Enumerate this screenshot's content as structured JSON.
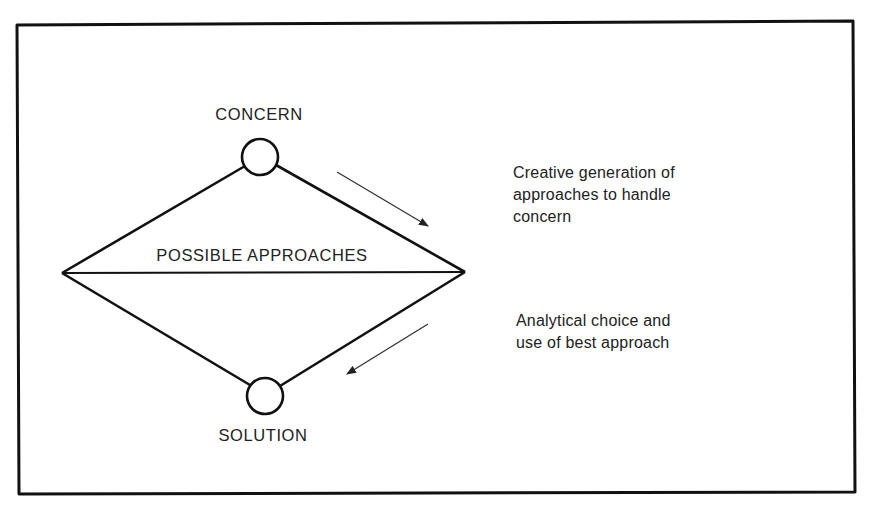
{
  "diagram": {
    "type": "problem-solving diamond",
    "nodes": {
      "top": {
        "label": "CONCERN"
      },
      "middle": {
        "label": "POSSIBLE APPROACHES"
      },
      "bottom": {
        "label": "SOLUTION"
      }
    },
    "annotations": {
      "divergent": {
        "lines": [
          "Creative generation of",
          "approaches to handle",
          "concern"
        ],
        "arrow_direction": "down-right"
      },
      "convergent": {
        "lines": [
          "Analytical choice and",
          "use of best approach"
        ],
        "arrow_direction": "down-left"
      }
    },
    "colors": {
      "stroke": "#111111",
      "arrow": "#333333",
      "text": "#222222",
      "background": "#ffffff"
    }
  }
}
